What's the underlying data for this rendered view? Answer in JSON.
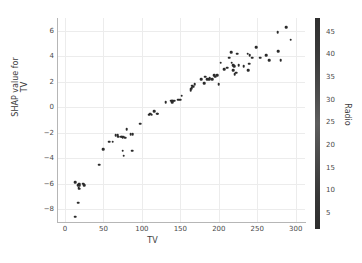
{
  "chart_data": {
    "type": "scatter",
    "title": "",
    "xlabel": "TV",
    "ylabel": "SHAP value for\nTV",
    "ylabel_line1": "SHAP value for",
    "ylabel_line2": "TV",
    "xlim": [
      -9,
      312
    ],
    "ylim": [
      -9.0,
      7.0
    ],
    "xticks": [
      0,
      50,
      100,
      150,
      200,
      250,
      300
    ],
    "yticks": [
      -8,
      -6,
      -4,
      -2,
      0,
      2,
      4,
      6
    ],
    "grid": true,
    "legend": "none",
    "colorbar": {
      "label": "Radio",
      "ticks": [
        5,
        10,
        15,
        20,
        25,
        30,
        35,
        40,
        45
      ],
      "vmin": 1.5,
      "vmax": 48.0,
      "position": "right",
      "colors": [
        "#2f2f2f",
        "#5d5d5d",
        "#2d2d2d"
      ]
    },
    "marker": {
      "color": "#2b2b2b",
      "size": 2.6,
      "shape": "circle"
    },
    "points": [
      {
        "x": 13.2,
        "y": -8.6,
        "c": 15.9
      },
      {
        "x": 17.2,
        "y": -7.5,
        "c": 4.1
      },
      {
        "x": 13.1,
        "y": -5.9,
        "c": 20.8
      },
      {
        "x": 16.9,
        "y": -6.1,
        "c": 43.7
      },
      {
        "x": 17.9,
        "y": -6.3,
        "c": 28.6
      },
      {
        "x": 18.7,
        "y": -6.4,
        "c": 12.1
      },
      {
        "x": 18.8,
        "y": -6.0,
        "c": 32.2
      },
      {
        "x": 19.4,
        "y": -6.1,
        "c": 16.0
      },
      {
        "x": 23.8,
        "y": -6.0,
        "c": 35.1
      },
      {
        "x": 25.0,
        "y": -6.1,
        "c": 11.0
      },
      {
        "x": 44.5,
        "y": -4.5,
        "c": 39.3
      },
      {
        "x": 50.0,
        "y": -3.3,
        "c": 11.6
      },
      {
        "x": 57.5,
        "y": -2.7,
        "c": 32.8
      },
      {
        "x": 62.3,
        "y": -2.7,
        "c": 12.6
      },
      {
        "x": 66.1,
        "y": -2.2,
        "c": 5.8
      },
      {
        "x": 68.4,
        "y": -2.2,
        "c": 44.5
      },
      {
        "x": 69.2,
        "y": -2.3,
        "c": 20.5
      },
      {
        "x": 73.4,
        "y": -2.3,
        "c": 28.9
      },
      {
        "x": 74.7,
        "y": -2.3,
        "c": 49.4
      },
      {
        "x": 75.1,
        "y": -2.4,
        "c": 15.4
      },
      {
        "x": 75.3,
        "y": -3.4,
        "c": 27.7
      },
      {
        "x": 76.3,
        "y": -2.3,
        "c": 27.5
      },
      {
        "x": 76.4,
        "y": -3.8,
        "c": 0.8
      },
      {
        "x": 78.2,
        "y": -2.4,
        "c": 46.8
      },
      {
        "x": 80.2,
        "y": -1.7,
        "c": 0.4
      },
      {
        "x": 85.7,
        "y": -2.1,
        "c": 35.8
      },
      {
        "x": 87.2,
        "y": -3.4,
        "c": 11.8
      },
      {
        "x": 88.3,
        "y": -2.1,
        "c": 25.5
      },
      {
        "x": 97.5,
        "y": -1.3,
        "c": 7.6
      },
      {
        "x": 109.8,
        "y": -0.6,
        "c": 47.8
      },
      {
        "x": 110.7,
        "y": -0.5,
        "c": 40.6
      },
      {
        "x": 112.9,
        "y": -0.6,
        "c": 17.4
      },
      {
        "x": 116.0,
        "y": -0.3,
        "c": 7.1
      },
      {
        "x": 120.2,
        "y": -0.5,
        "c": 19.6
      },
      {
        "x": 120.5,
        "y": -0.5,
        "c": 28.5
      },
      {
        "x": 131.1,
        "y": 0.4,
        "c": 42.8
      },
      {
        "x": 137.9,
        "y": 0.5,
        "c": 46.4
      },
      {
        "x": 139.2,
        "y": 0.5,
        "c": 14.3
      },
      {
        "x": 139.3,
        "y": 0.4,
        "c": 2.1
      },
      {
        "x": 140.3,
        "y": 0.5,
        "c": 1.9
      },
      {
        "x": 141.3,
        "y": 0.5,
        "c": 26.8
      },
      {
        "x": 142.9,
        "y": 0.5,
        "c": 29.3
      },
      {
        "x": 147.3,
        "y": 0.6,
        "c": 23.9
      },
      {
        "x": 149.7,
        "y": 0.6,
        "c": 35.6
      },
      {
        "x": 151.5,
        "y": 0.9,
        "c": 2.4
      },
      {
        "x": 163.3,
        "y": 1.3,
        "c": 31.6
      },
      {
        "x": 163.5,
        "y": 1.4,
        "c": 36.8
      },
      {
        "x": 164.5,
        "y": 1.5,
        "c": 20.9
      },
      {
        "x": 165.6,
        "y": 1.7,
        "c": 10.0
      },
      {
        "x": 166.8,
        "y": 1.6,
        "c": 42.0
      },
      {
        "x": 168.4,
        "y": 1.8,
        "c": 7.1
      },
      {
        "x": 177.0,
        "y": 2.2,
        "c": 33.4
      },
      {
        "x": 180.8,
        "y": 1.9,
        "c": 4.1
      },
      {
        "x": 182.6,
        "y": 2.4,
        "c": 46.2
      },
      {
        "x": 184.9,
        "y": 2.2,
        "c": 21.0
      },
      {
        "x": 187.8,
        "y": 2.2,
        "c": 21.1
      },
      {
        "x": 188.4,
        "y": 2.3,
        "c": 18.1
      },
      {
        "x": 191.1,
        "y": 2.2,
        "c": 28.7
      },
      {
        "x": 193.7,
        "y": 2.5,
        "c": 35.4
      },
      {
        "x": 195.4,
        "y": 2.4,
        "c": 2.9
      },
      {
        "x": 197.6,
        "y": 2.5,
        "c": 3.5
      },
      {
        "x": 199.8,
        "y": 1.8,
        "c": 2.6
      },
      {
        "x": 202.5,
        "y": 3.5,
        "c": 22.3
      },
      {
        "x": 206.8,
        "y": 3.0,
        "c": 8.4
      },
      {
        "x": 210.8,
        "y": 3.1,
        "c": 49.6
      },
      {
        "x": 213.4,
        "y": 3.9,
        "c": 13.4
      },
      {
        "x": 216.4,
        "y": 4.3,
        "c": 41.7
      },
      {
        "x": 216.8,
        "y": 3.5,
        "c": 43.9
      },
      {
        "x": 218.4,
        "y": 3.3,
        "c": 7.4
      },
      {
        "x": 218.5,
        "y": 2.9,
        "c": 5.4
      },
      {
        "x": 220.3,
        "y": 3.2,
        "c": 49.0
      },
      {
        "x": 220.5,
        "y": 2.6,
        "c": 33.2
      },
      {
        "x": 222.4,
        "y": 2.7,
        "c": 4.3
      },
      {
        "x": 224.0,
        "y": 4.2,
        "c": 2.4
      },
      {
        "x": 225.8,
        "y": 3.3,
        "c": 8.2
      },
      {
        "x": 232.1,
        "y": 3.2,
        "c": 8.6
      },
      {
        "x": 237.4,
        "y": 4.2,
        "c": 27.5
      },
      {
        "x": 238.2,
        "y": 2.9,
        "c": 34.3
      },
      {
        "x": 239.8,
        "y": 3.4,
        "c": 4.1
      },
      {
        "x": 240.1,
        "y": 4.1,
        "c": 7.3
      },
      {
        "x": 243.2,
        "y": 3.9,
        "c": 49.0
      },
      {
        "x": 248.8,
        "y": 4.7,
        "c": 27.1
      },
      {
        "x": 253.8,
        "y": 3.9,
        "c": 8.4
      },
      {
        "x": 261.3,
        "y": 4.1,
        "c": 42.7
      },
      {
        "x": 265.2,
        "y": 3.7,
        "c": 2.9
      },
      {
        "x": 276.7,
        "y": 5.9,
        "c": 8.4
      },
      {
        "x": 276.9,
        "y": 4.4,
        "c": 48.9
      },
      {
        "x": 280.2,
        "y": 3.7,
        "c": 10.1
      },
      {
        "x": 287.6,
        "y": 6.3,
        "c": 43.0
      },
      {
        "x": 293.6,
        "y": 5.3,
        "c": 27.7
      }
    ]
  }
}
